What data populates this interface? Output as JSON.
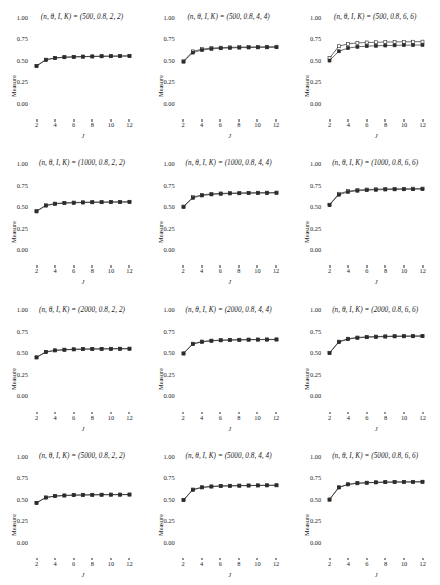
{
  "figure": {
    "type": "multi-panel-line-chart",
    "rows": 4,
    "cols": 3,
    "axis_labels": {
      "x": "J",
      "y": "Measure"
    },
    "x_ticks": [
      "2",
      "4",
      "6",
      "8",
      "10",
      "12"
    ],
    "y_ticks": [
      "1.00",
      "0.75",
      "0.50",
      "0.25",
      "0.00"
    ],
    "x_range": [
      1.3,
      12.7
    ],
    "y_range": [
      0.0,
      1.0
    ],
    "title_prefix": "(n, θ, I, K) = ",
    "series_names": [
      "open-square-series",
      "filled-square-series"
    ],
    "colors": {
      "line": "#2b2b2b",
      "marker_fill_open": "#ffffff",
      "marker_fill_closed": "#2b2b2b",
      "background": "#ffffff"
    }
  },
  "chart_data": {
    "type": "line",
    "title": "",
    "xlabel": "J",
    "ylabel": "Measure",
    "xlim": [
      1.3,
      12.7
    ],
    "ylim": [
      0.0,
      1.0
    ],
    "x": [
      2,
      3,
      4,
      5,
      6,
      7,
      8,
      9,
      10,
      11,
      12
    ],
    "grid": false,
    "legend": "none",
    "panels": [
      {
        "row": 1,
        "col": 1,
        "title": "(n, θ, I, K) = (500, 0.8, 2, 2)",
        "params": {
          "n": 500,
          "theta": 0.8,
          "I": 2,
          "K": 2
        },
        "series": [
          {
            "name": "open-square-series",
            "marker": "open-square",
            "values": [
              0.443,
              0.516,
              0.536,
              0.545,
              0.549,
              0.552,
              0.554,
              0.556,
              0.557,
              0.558,
              0.56
            ]
          },
          {
            "name": "filled-square-series",
            "marker": "filled-square",
            "values": [
              0.44,
              0.513,
              0.534,
              0.543,
              0.547,
              0.55,
              0.552,
              0.554,
              0.555,
              0.556,
              0.558
            ]
          }
        ]
      },
      {
        "row": 1,
        "col": 2,
        "title": "(n, θ, I, K) = (500, 0.8, 4, 4)",
        "params": {
          "n": 500,
          "theta": 0.8,
          "I": 4,
          "K": 4
        },
        "series": [
          {
            "name": "open-square-series",
            "marker": "open-square",
            "values": [
              0.497,
              0.612,
              0.638,
              0.65,
              0.655,
              0.659,
              0.661,
              0.663,
              0.664,
              0.665,
              0.666
            ]
          },
          {
            "name": "filled-square-series",
            "marker": "filled-square",
            "values": [
              0.492,
              0.598,
              0.627,
              0.641,
              0.648,
              0.652,
              0.655,
              0.657,
              0.658,
              0.659,
              0.66
            ]
          }
        ]
      },
      {
        "row": 1,
        "col": 3,
        "title": "(n, θ, I, K) = (500, 0.8, 6, 6)",
        "params": {
          "n": 500,
          "theta": 0.8,
          "I": 6,
          "K": 6
        },
        "series": [
          {
            "name": "open-square-series",
            "marker": "open-square",
            "values": [
              0.533,
              0.672,
              0.7,
              0.71,
              0.715,
              0.718,
              0.72,
              0.722,
              0.723,
              0.724,
              0.725
            ]
          },
          {
            "name": "filled-square-series",
            "marker": "filled-square",
            "values": [
              0.505,
              0.613,
              0.65,
              0.665,
              0.673,
              0.677,
              0.68,
              0.682,
              0.684,
              0.685,
              0.686
            ]
          }
        ]
      },
      {
        "row": 2,
        "col": 1,
        "title": "(n, θ, I, K) = (1000, 0.8, 2, 2)",
        "params": {
          "n": 1000,
          "theta": 0.8,
          "I": 2,
          "K": 2
        },
        "series": [
          {
            "name": "open-square-series",
            "marker": "open-square",
            "values": [
              0.452,
              0.52,
              0.54,
              0.548,
              0.552,
              0.555,
              0.557,
              0.558,
              0.559,
              0.56,
              0.561
            ]
          },
          {
            "name": "filled-square-series",
            "marker": "filled-square",
            "values": [
              0.448,
              0.516,
              0.536,
              0.545,
              0.549,
              0.552,
              0.554,
              0.555,
              0.556,
              0.557,
              0.558
            ]
          }
        ]
      },
      {
        "row": 2,
        "col": 2,
        "title": "(n, θ, I, K) = (1000, 0.8, 4, 4)",
        "params": {
          "n": 1000,
          "theta": 0.8,
          "I": 4,
          "K": 4
        },
        "series": [
          {
            "name": "open-square-series",
            "marker": "open-square",
            "values": [
              0.505,
              0.615,
              0.641,
              0.652,
              0.658,
              0.661,
              0.663,
              0.665,
              0.666,
              0.667,
              0.668
            ]
          },
          {
            "name": "filled-square-series",
            "marker": "filled-square",
            "values": [
              0.501,
              0.606,
              0.634,
              0.646,
              0.653,
              0.657,
              0.659,
              0.661,
              0.662,
              0.663,
              0.664
            ]
          }
        ]
      },
      {
        "row": 2,
        "col": 3,
        "title": "(n, θ, I, K) = (1000, 0.8, 6, 6)",
        "params": {
          "n": 1000,
          "theta": 0.8,
          "I": 6,
          "K": 6
        },
        "series": [
          {
            "name": "open-square-series",
            "marker": "open-square",
            "values": [
              0.527,
              0.654,
              0.685,
              0.697,
              0.703,
              0.707,
              0.709,
              0.711,
              0.712,
              0.713,
              0.714
            ]
          },
          {
            "name": "filled-square-series",
            "marker": "filled-square",
            "values": [
              0.523,
              0.643,
              0.675,
              0.689,
              0.696,
              0.7,
              0.703,
              0.705,
              0.706,
              0.707,
              0.708
            ]
          }
        ]
      },
      {
        "row": 3,
        "col": 1,
        "title": "(n, θ, I, K) = (2000, 0.8, 2, 2)",
        "params": {
          "n": 2000,
          "theta": 0.8,
          "I": 2,
          "K": 2
        },
        "series": [
          {
            "name": "open-square-series",
            "marker": "open-square",
            "values": [
              0.462,
              0.525,
              0.543,
              0.551,
              0.555,
              0.558,
              0.559,
              0.56,
              0.561,
              0.562,
              0.563
            ]
          },
          {
            "name": "filled-square-series",
            "marker": "filled-square",
            "values": [
              0.459,
              0.522,
              0.541,
              0.549,
              0.553,
              0.556,
              0.557,
              0.559,
              0.56,
              0.561,
              0.561
            ]
          }
        ]
      },
      {
        "row": 3,
        "col": 2,
        "title": "(n, θ, I, K) = (2000, 0.8, 4, 4)",
        "params": {
          "n": 2000,
          "theta": 0.8,
          "I": 4,
          "K": 4
        },
        "series": [
          {
            "name": "open-square-series",
            "marker": "open-square",
            "values": [
              0.508,
              0.62,
              0.645,
              0.656,
              0.661,
              0.664,
              0.666,
              0.668,
              0.669,
              0.67,
              0.67
            ]
          },
          {
            "name": "filled-square-series",
            "marker": "filled-square",
            "values": [
              0.505,
              0.615,
              0.641,
              0.653,
              0.658,
              0.662,
              0.664,
              0.666,
              0.667,
              0.667,
              0.668
            ]
          }
        ]
      },
      {
        "row": 3,
        "col": 3,
        "title": "(n, θ, I, K) = (2000, 0.8, 6, 6)",
        "params": {
          "n": 2000,
          "theta": 0.8,
          "I": 6,
          "K": 6
        },
        "series": [
          {
            "name": "open-square-series",
            "marker": "open-square",
            "values": [
              0.513,
              0.644,
              0.678,
              0.692,
              0.699,
              0.703,
              0.706,
              0.708,
              0.709,
              0.71,
              0.711
            ]
          },
          {
            "name": "filled-square-series",
            "marker": "filled-square",
            "values": [
              0.51,
              0.638,
              0.673,
              0.688,
              0.695,
              0.699,
              0.702,
              0.704,
              0.705,
              0.706,
              0.707
            ]
          }
        ]
      },
      {
        "row": 4,
        "col": 1,
        "title": "(n, θ, I, K) = (5000, 0.8, 2, 2)",
        "params": {
          "n": 5000,
          "theta": 0.8,
          "I": 2,
          "K": 2
        },
        "series": [
          {
            "name": "open-square-series",
            "marker": "open-square",
            "values": [
              0.468,
              0.53,
              0.546,
              0.553,
              0.557,
              0.559,
              0.561,
              0.562,
              0.563,
              0.563,
              0.564
            ]
          },
          {
            "name": "filled-square-series",
            "marker": "filled-square",
            "values": [
              0.466,
              0.528,
              0.545,
              0.552,
              0.556,
              0.558,
              0.56,
              0.561,
              0.562,
              0.562,
              0.563
            ]
          }
        ]
      },
      {
        "row": 4,
        "col": 2,
        "title": "(n, θ, I, K) = (5000, 0.8, 4, 4)",
        "params": {
          "n": 5000,
          "theta": 0.8,
          "I": 4,
          "K": 4
        },
        "series": [
          {
            "name": "open-square-series",
            "marker": "open-square",
            "values": [
              0.5,
              0.622,
              0.648,
              0.658,
              0.663,
              0.666,
              0.668,
              0.669,
              0.67,
              0.671,
              0.672
            ]
          },
          {
            "name": "filled-square-series",
            "marker": "filled-square",
            "values": [
              0.498,
              0.619,
              0.646,
              0.656,
              0.661,
              0.664,
              0.666,
              0.668,
              0.669,
              0.67,
              0.67
            ]
          }
        ]
      },
      {
        "row": 4,
        "col": 3,
        "title": "(n, θ, I, K) = (5000, 0.8, 6, 6)",
        "params": {
          "n": 5000,
          "theta": 0.8,
          "I": 6,
          "K": 6
        },
        "series": [
          {
            "name": "open-square-series",
            "marker": "open-square",
            "values": [
              0.506,
              0.648,
              0.683,
              0.696,
              0.702,
              0.706,
              0.708,
              0.71,
              0.711,
              0.712,
              0.713
            ]
          },
          {
            "name": "filled-square-series",
            "marker": "filled-square",
            "values": [
              0.504,
              0.645,
              0.681,
              0.694,
              0.7,
              0.704,
              0.707,
              0.708,
              0.709,
              0.71,
              0.711
            ]
          }
        ]
      }
    ]
  }
}
